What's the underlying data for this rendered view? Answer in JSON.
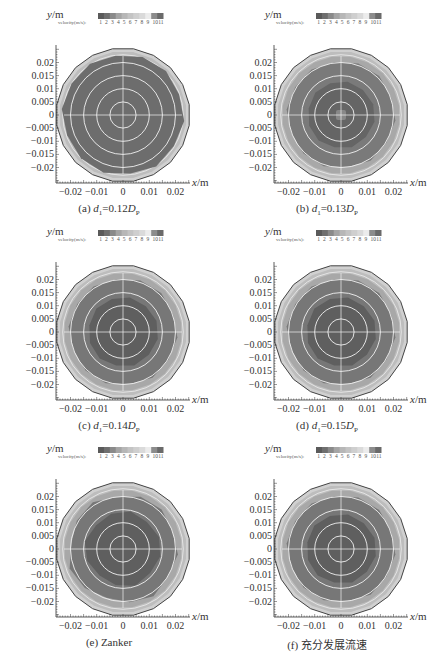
{
  "figure": {
    "bottom_caption": "",
    "legend": {
      "label": "velocity(m/s):",
      "ticks": [
        "1",
        "2",
        "3",
        "4",
        "5",
        "6",
        "7",
        "8",
        "9",
        "10",
        "11"
      ],
      "colors": [
        "#5a5a5a",
        "#6f6f6f",
        "#8a8a8a",
        "#a5a5a5",
        "#b7b7b7",
        "#c4c4c4",
        "#cfcfcf",
        "#dadada",
        "#ececec",
        "#8c8c8c",
        "#6a6a6a"
      ]
    },
    "axis": {
      "ylabel": "y/m",
      "xlabel": "x/m",
      "yticks": [
        "0.02",
        "0.015",
        "0.01",
        "0.005",
        "0",
        "-0.005",
        "-0.01",
        "-0.015",
        "-0.02"
      ],
      "xticks": [
        "-0.02",
        "-0.01",
        "0",
        "0.01",
        "0.02"
      ]
    },
    "panels": [
      {
        "id": "a",
        "caption_prefix": "(a) ",
        "caption_var": "d",
        "caption_sub": "1",
        "caption_mid": "=0.12",
        "caption_var2": "D",
        "caption_sub2": "P"
      },
      {
        "id": "b",
        "caption_prefix": "(b) ",
        "caption_var": "d",
        "caption_sub": "1",
        "caption_mid": "=0.13",
        "caption_var2": "D",
        "caption_sub2": "P"
      },
      {
        "id": "c",
        "caption_prefix": "(c) ",
        "caption_var": "d",
        "caption_sub": "1",
        "caption_mid": "=0.14",
        "caption_var2": "D",
        "caption_sub2": "P"
      },
      {
        "id": "d",
        "caption_prefix": "(d) ",
        "caption_var": "d",
        "caption_sub": "1",
        "caption_mid": "=0.15",
        "caption_var2": "D",
        "caption_sub2": "P"
      },
      {
        "id": "e",
        "caption_prefix": "(e) Zanker",
        "caption_var": "",
        "caption_sub": "",
        "caption_mid": "",
        "caption_var2": "",
        "caption_sub2": ""
      },
      {
        "id": "f",
        "caption_prefix": "(f) 充分发展流速",
        "caption_var": "",
        "caption_sub": "",
        "caption_mid": "",
        "caption_var2": "",
        "caption_sub2": ""
      }
    ]
  },
  "chart_data": [
    {
      "type": "heatmap",
      "title": "(a) d1=0.12Dp",
      "xlabel": "x/m",
      "ylabel": "y/m",
      "xlim": [
        -0.025,
        0.025
      ],
      "ylim": [
        -0.025,
        0.025
      ],
      "legend": "velocity(m/s): 1–11",
      "description": "Nearly uniform core velocity across pipe cross-section, thin boundary gradient",
      "core_level": 10,
      "rings": [
        0.005,
        0.01,
        0.015,
        0.02
      ]
    },
    {
      "type": "heatmap",
      "title": "(b) d1=0.13Dp",
      "xlabel": "x/m",
      "ylabel": "y/m",
      "xlim": [
        -0.025,
        0.025
      ],
      "ylim": [
        -0.025,
        0.025
      ],
      "legend": "velocity(m/s): 1–11",
      "description": "Core darker region with small lighter center spot; outer band lighter",
      "core_level": 11,
      "rings": [
        0.005,
        0.01,
        0.015,
        0.02
      ]
    },
    {
      "type": "heatmap",
      "title": "(c) d1=0.14Dp",
      "xlabel": "x/m",
      "ylabel": "y/m",
      "xlim": [
        -0.025,
        0.025
      ],
      "ylim": [
        -0.025,
        0.025
      ],
      "legend": "velocity(m/s): 1–11",
      "description": "Darker core of radius ~0.012 m surrounded by medium band",
      "core_level": 11,
      "rings": [
        0.005,
        0.01,
        0.015,
        0.02
      ]
    },
    {
      "type": "heatmap",
      "title": "(d) d1=0.15Dp",
      "xlabel": "x/m",
      "ylabel": "y/m",
      "xlim": [
        -0.025,
        0.025
      ],
      "ylim": [
        -0.025,
        0.025
      ],
      "legend": "velocity(m/s): 1–11",
      "description": "Darker core radius ~0.012 m, medium band, light boundary",
      "core_level": 11,
      "rings": [
        0.005,
        0.01,
        0.015,
        0.02
      ]
    },
    {
      "type": "heatmap",
      "title": "(e) Zanker",
      "xlabel": "x/m",
      "ylabel": "y/m",
      "xlim": [
        -0.025,
        0.025
      ],
      "ylim": [
        -0.025,
        0.025
      ],
      "legend": "velocity(m/s): 1–11",
      "description": "Slightly asymmetric darker core, medium band",
      "core_level": 11,
      "rings": [
        0.005,
        0.01,
        0.015,
        0.02
      ]
    },
    {
      "type": "heatmap",
      "title": "(f) 充分发展流速",
      "xlabel": "x/m",
      "ylabel": "y/m",
      "xlim": [
        -0.025,
        0.025
      ],
      "ylim": [
        -0.025,
        0.025
      ],
      "legend": "velocity(m/s): 1–11",
      "description": "Fully developed profile: dark core radius ~0.012 m, medium band, light boundary layer",
      "core_level": 11,
      "rings": [
        0.005,
        0.01,
        0.015,
        0.02
      ]
    }
  ]
}
